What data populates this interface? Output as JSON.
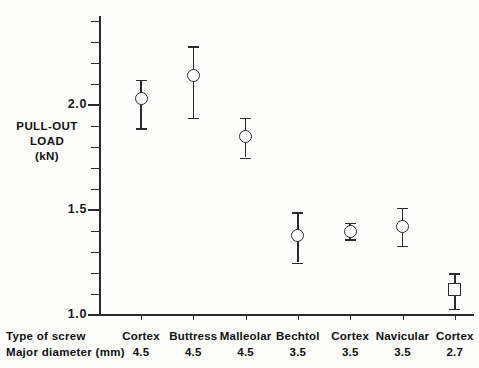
{
  "chart_data": {
    "type": "scatter",
    "title": "",
    "xlabel": "Type of screw / Major diameter (mm)",
    "ylabel": "PULL-OUT LOAD (kN)",
    "ylim": [
      1.0,
      2.42
    ],
    "yticks_major": [
      1.0,
      1.5,
      2.0
    ],
    "ytick_labels": [
      "1.0",
      "1.5",
      "2.0"
    ],
    "grid": false,
    "legend": "none",
    "error_bars": "vertical, capped",
    "categories": [
      "Cortex",
      "Buttress",
      "Malleolar",
      "Bechtol",
      "Cortex",
      "Navicular",
      "Cortex"
    ],
    "diameters": [
      "4.5",
      "4.5",
      "4.5",
      "3.5",
      "3.5",
      "3.5",
      "2.7"
    ],
    "values": [
      2.03,
      2.14,
      1.85,
      1.38,
      1.4,
      1.42,
      1.12
    ],
    "err_high": [
      2.12,
      2.28,
      1.94,
      1.49,
      1.44,
      1.51,
      1.2
    ],
    "err_low": [
      1.89,
      1.94,
      1.75,
      1.25,
      1.36,
      1.33,
      1.03
    ],
    "markers": [
      "circle",
      "circle",
      "circle",
      "circle",
      "circle",
      "circle",
      "square"
    ],
    "points": [
      {
        "category": "Cortex",
        "diameter": "4.5",
        "value": 2.03,
        "high": 2.12,
        "low": 1.89,
        "marker": "circle"
      },
      {
        "category": "Buttress",
        "diameter": "4.5",
        "value": 2.14,
        "high": 2.28,
        "low": 1.94,
        "marker": "circle"
      },
      {
        "category": "Malleolar",
        "diameter": "4.5",
        "value": 1.85,
        "high": 1.94,
        "low": 1.75,
        "marker": "circle"
      },
      {
        "category": "Bechtol",
        "diameter": "3.5",
        "value": 1.38,
        "high": 1.49,
        "low": 1.25,
        "marker": "circle"
      },
      {
        "category": "Cortex",
        "diameter": "3.5",
        "value": 1.4,
        "high": 1.44,
        "low": 1.36,
        "marker": "circle"
      },
      {
        "category": "Navicular",
        "diameter": "3.5",
        "value": 1.42,
        "high": 1.51,
        "low": 1.33,
        "marker": "circle"
      },
      {
        "category": "Cortex",
        "diameter": "2.7",
        "value": 1.12,
        "high": 1.2,
        "low": 1.03,
        "marker": "square"
      }
    ]
  },
  "axis": {
    "y_title_line1": "PULL-OUT",
    "y_title_line2": "LOAD",
    "y_title_line3": "(kN)",
    "y_labels": [
      "2.0",
      "1.5",
      "1.0"
    ],
    "minor_tick_step": 0.1
  },
  "bottom_table": {
    "row1_label": "Type of screw",
    "row2_label": "Major diameter (mm)"
  },
  "colors": {
    "ink": "#2b2b2b",
    "text": "#111111",
    "background": "#fdfdfc",
    "marker_fill": "#ffffff"
  }
}
